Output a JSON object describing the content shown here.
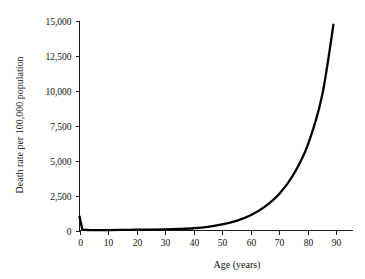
{
  "chart_data": {
    "type": "line",
    "title": "",
    "xlabel": "Age (years)",
    "ylabel": "Death rate per 100,000 population",
    "xlim": [
      0,
      95
    ],
    "ylim": [
      0,
      15000
    ],
    "grid": false,
    "legend": null,
    "xticks": [
      0,
      10,
      20,
      30,
      40,
      50,
      60,
      70,
      80,
      90
    ],
    "xtick_labels": [
      "0",
      "10",
      "20",
      "30",
      "40",
      "50",
      "60",
      "70",
      "80",
      "90"
    ],
    "yticks": [
      0,
      2500,
      5000,
      7500,
      10000,
      12500,
      15000
    ],
    "ytick_labels": [
      "0",
      "2,500",
      "5,000",
      "7,500",
      "10,000",
      "12,500",
      "15,000"
    ],
    "series": [
      {
        "name": "Death rate",
        "color": "#000000",
        "x": [
          0,
          1,
          2,
          3,
          5,
          10,
          15,
          20,
          25,
          30,
          35,
          40,
          45,
          50,
          55,
          60,
          65,
          70,
          75,
          80,
          85,
          89
        ],
        "y": [
          1000,
          70,
          40,
          35,
          30,
          28,
          40,
          55,
          65,
          80,
          110,
          160,
          260,
          430,
          690,
          1090,
          1700,
          2600,
          4000,
          6100,
          9600,
          14700
        ]
      }
    ]
  },
  "axes": {
    "x_axis_label": "Age (years)",
    "y_axis_label": "Death rate per 100,000 population"
  }
}
